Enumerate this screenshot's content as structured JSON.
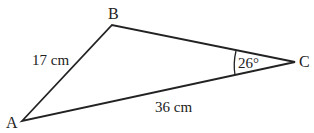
{
  "diagram": {
    "type": "triangle",
    "vertices": {
      "A": {
        "label": "A"
      },
      "B": {
        "label": "B"
      },
      "C": {
        "label": "C"
      }
    },
    "sides": {
      "AB": {
        "label": "17 cm"
      },
      "AC": {
        "label": "36 cm"
      }
    },
    "angles": {
      "C": {
        "label": "26°"
      }
    },
    "colors": {
      "stroke": "#222222",
      "background": "#ffffff"
    }
  }
}
